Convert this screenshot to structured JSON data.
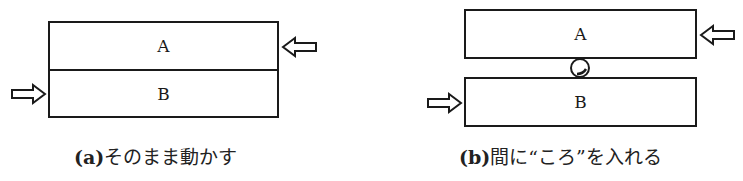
{
  "figure": {
    "panels": [
      {
        "id": "a",
        "blocks": [
          {
            "label": "A"
          },
          {
            "label": "B"
          }
        ],
        "caption": {
          "label": "(a)",
          "text": "そのまま動かす"
        },
        "arrows": [
          {
            "block": "A",
            "side": "right",
            "direction": "left"
          },
          {
            "block": "B",
            "side": "left",
            "direction": "right"
          }
        ]
      },
      {
        "id": "b",
        "blocks": [
          {
            "label": "A"
          },
          {
            "label": "B"
          }
        ],
        "roller": "ころ",
        "caption": {
          "label": "(b)",
          "text": "間に“ころ”を入れる"
        },
        "arrows": [
          {
            "block": "A",
            "side": "right",
            "direction": "left"
          },
          {
            "block": "B",
            "side": "left",
            "direction": "right"
          }
        ]
      }
    ],
    "colors": {
      "line": "#1a1a1a",
      "background": "#ffffff"
    }
  }
}
